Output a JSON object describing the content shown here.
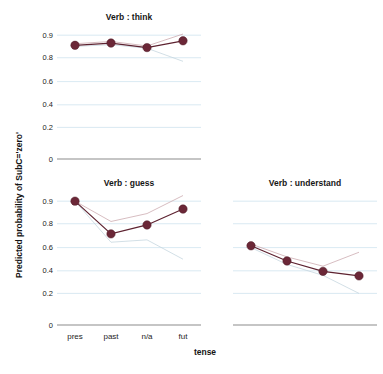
{
  "figure": {
    "y_axis_title": "Predicted probability of SubC='zero'",
    "x_axis_title": "tense",
    "marker_color": "#6b2737",
    "line_color": "#5d2230",
    "gridline_color": "#cfe3ef",
    "baseline_color": "#8b8b8b",
    "band_upper_color": "#c9a7ac",
    "band_lower_color": "#c3d4dd"
  },
  "chart_data": {
    "type": "line",
    "title": "",
    "xlabel": "tense",
    "ylabel": "Predicted probability of SubC='zero'",
    "categories": [
      "pres",
      "past",
      "n/a",
      "fut"
    ],
    "ylim": [
      0,
      0.95
    ],
    "yticks": [
      0,
      0.2,
      0.4,
      0.6,
      0.8,
      0.9
    ],
    "ytick_labels": [
      "0",
      "0.2",
      "0.4",
      "0.6",
      "0.8",
      "0.9"
    ],
    "grid": true,
    "legend": "none",
    "axis_scale": "non-linear (compressed above 0.8)",
    "panels": [
      {
        "name": "think",
        "title": "Verb : think",
        "values": [
          0.855,
          0.865,
          0.845,
          0.875
        ],
        "band_upper": [
          0.862,
          0.872,
          0.852,
          0.905
        ],
        "band_lower": [
          0.85,
          0.858,
          0.842,
          0.77
        ]
      },
      {
        "name": "guess",
        "title": "Verb : guess",
        "values": [
          0.9,
          0.715,
          0.79,
          0.865
        ],
        "band_upper": [
          0.9,
          0.81,
          0.845,
          0.925
        ],
        "band_lower": [
          0.9,
          0.645,
          0.665,
          0.5
        ]
      },
      {
        "name": "understand",
        "title": "Verb : understand",
        "values": [
          0.615,
          0.485,
          0.395,
          0.355
        ],
        "band_upper": [
          0.63,
          0.52,
          0.44,
          0.56
        ],
        "band_lower": [
          0.6,
          0.455,
          0.36,
          0.2
        ]
      }
    ]
  }
}
